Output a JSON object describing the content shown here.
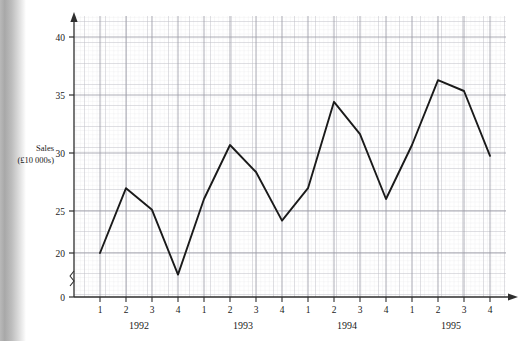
{
  "chart_data": {
    "type": "line",
    "title": "",
    "subtitle": "",
    "xlabel": "",
    "ylabel": "Sales (£10 000s)",
    "ylabel_line1": "Sales",
    "ylabel_line2": "(£10 000s)",
    "grid": true,
    "grid_style": "graph-paper",
    "legend": "none",
    "axis_break": true,
    "axis_break_symbol": "zigzag",
    "ylim": [
      0,
      42
    ],
    "y_plot_min": 17,
    "y_plot_max": 42,
    "yticks": [
      0,
      20,
      25,
      30,
      35,
      40
    ],
    "ytick_labels": [
      "0",
      "20",
      "25",
      "30",
      "35",
      "40"
    ],
    "x": [
      1,
      2,
      3,
      4,
      5,
      6,
      7,
      8,
      9,
      10,
      11,
      12,
      13,
      14,
      15,
      16
    ],
    "categories": [
      "1992 Q1",
      "1992 Q2",
      "1992 Q3",
      "1992 Q4",
      "1993 Q1",
      "1993 Q2",
      "1993 Q3",
      "1993 Q4",
      "1994 Q1",
      "1994 Q2",
      "1994 Q3",
      "1994 Q4",
      "1995 Q1",
      "1995 Q2",
      "1995 Q3",
      "1995 Q4"
    ],
    "quarter_labels": [
      "1",
      "2",
      "3",
      "4",
      "1",
      "2",
      "3",
      "4",
      "1",
      "2",
      "3",
      "4",
      "1",
      "2",
      "3",
      "4"
    ],
    "year_groups": [
      {
        "label": "1992",
        "quarters": [
          "1",
          "2",
          "3",
          "4"
        ]
      },
      {
        "label": "1993",
        "quarters": [
          "1",
          "2",
          "3",
          "4"
        ]
      },
      {
        "label": "1994",
        "quarters": [
          "1",
          "2",
          "3",
          "4"
        ]
      },
      {
        "label": "1995",
        "quarters": [
          "1",
          "2",
          "3",
          "4"
        ]
      }
    ],
    "values": [
      20,
      26,
      24,
      18,
      25,
      30,
      27.5,
      23,
      26,
      34,
      31,
      25,
      30,
      36,
      35,
      29
    ],
    "series": [
      {
        "name": "Sales",
        "values": [
          20,
          26,
          24,
          18,
          25,
          30,
          27.5,
          23,
          26,
          34,
          31,
          25,
          30,
          36,
          35,
          29
        ],
        "color": "#1a1a1a",
        "line_width": 1.9,
        "markers": "none"
      }
    ],
    "colors": {
      "line": "#1a1a1a",
      "axis": "#3a3a3a",
      "grid_minor": "#e2e2e6",
      "grid_major": "#b6b6be",
      "background": "#ffffff",
      "text": "#1a1a1a"
    }
  }
}
